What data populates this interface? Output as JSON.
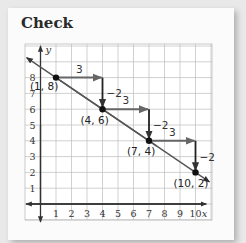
{
  "header": {
    "title": "Check"
  },
  "chart_data": {
    "type": "line",
    "title": "Check",
    "xlabel": "x",
    "ylabel": "y",
    "xlim": [
      -1,
      10.5
    ],
    "ylim": [
      -1,
      9.5
    ],
    "grid": true,
    "x_ticks": [
      "1",
      "2",
      "3",
      "4",
      "5",
      "6",
      "7",
      "8",
      "9",
      "10"
    ],
    "y_ticks": [
      "1",
      "2",
      "3",
      "4",
      "5",
      "6",
      "7",
      "8"
    ],
    "points": [
      {
        "x": 1,
        "y": 8,
        "label": "(1, 8)"
      },
      {
        "x": 4,
        "y": 6,
        "label": "(4, 6)"
      },
      {
        "x": 7,
        "y": 4,
        "label": "(7, 4)"
      },
      {
        "x": 10,
        "y": 2,
        "label": "(10, 2)"
      }
    ],
    "line": {
      "slope": -0.6667,
      "description": "line through (1,8) and (10,2), arrows both ends"
    },
    "steps": [
      {
        "run_label": "3",
        "rise_label": "−2",
        "from": [
          1,
          8
        ],
        "corner": [
          4,
          8
        ],
        "to": [
          4,
          6
        ]
      },
      {
        "run_label": "3",
        "rise_label": "−2",
        "from": [
          4,
          6
        ],
        "corner": [
          7,
          6
        ],
        "to": [
          7,
          4
        ]
      },
      {
        "run_label": "3",
        "rise_label": "−2",
        "from": [
          7,
          4
        ],
        "corner": [
          10,
          4
        ],
        "to": [
          10,
          2
        ]
      }
    ]
  },
  "colors": {
    "line": "#555555",
    "step_arrow": "#666666",
    "point": "#111111",
    "grid": "#bdbdbd"
  }
}
